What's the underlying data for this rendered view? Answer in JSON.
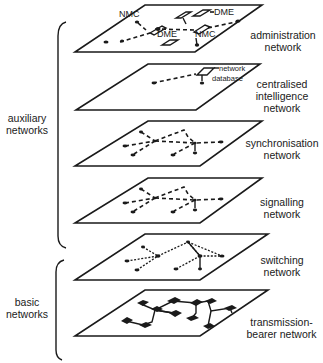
{
  "diagram": {
    "groups": [
      {
        "label_line1": "auxiliary",
        "label_line2": "networks"
      },
      {
        "label_line1": "basic",
        "label_line2": "networks"
      }
    ],
    "layers": [
      {
        "id": "administration",
        "label_line1": "administration",
        "label_line2": "network",
        "label_line3": "",
        "annotations": [
          "NMC",
          "DME",
          "DME",
          "NMC"
        ]
      },
      {
        "id": "centralised-intelligence",
        "label_line1": "centralised",
        "label_line2": "intelligence",
        "label_line3": "network",
        "annotations": [
          "network",
          "database"
        ]
      },
      {
        "id": "synchronisation",
        "label_line1": "synchronisation",
        "label_line2": "network",
        "label_line3": "",
        "annotations": []
      },
      {
        "id": "signalling",
        "label_line1": "signalling",
        "label_line2": "network",
        "label_line3": "",
        "annotations": []
      },
      {
        "id": "switching",
        "label_line1": "switching",
        "label_line2": "network",
        "label_line3": "",
        "annotations": []
      },
      {
        "id": "transmission-bearer",
        "label_line1": "transmission-",
        "label_line2": "bearer network",
        "label_line3": "",
        "annotations": []
      }
    ],
    "colors": {
      "ink": "#1a1a1a",
      "background": "#ffffff"
    }
  }
}
